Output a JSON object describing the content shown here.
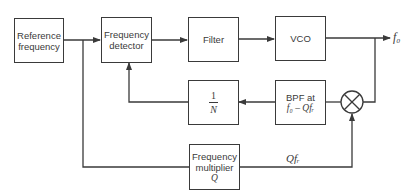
{
  "diagram": {
    "type": "block-diagram",
    "blocks": [
      {
        "id": "ref",
        "line1": "Reference",
        "line2": "frequency"
      },
      {
        "id": "det",
        "line1": "Frequency",
        "line2": "detector"
      },
      {
        "id": "filter",
        "label": "Filter"
      },
      {
        "id": "vco",
        "label": "VCO"
      },
      {
        "id": "divider",
        "num": "1",
        "den": "N"
      },
      {
        "id": "bpf",
        "line1": "BPF at",
        "line2": "f₀ – Qfᵣ"
      },
      {
        "id": "mult",
        "line1": "Frequency",
        "line2": "multiplier",
        "line3": "Q"
      }
    ],
    "mixer": {
      "symbol": "multiplier-circle"
    },
    "labels": {
      "output": "f₀",
      "mult_output": "Qfᵣ"
    },
    "connections": [
      "ref -> det",
      "det -> filter",
      "filter -> vco",
      "vco -> output f0",
      "output tap -> mixer",
      "mixer -> bpf",
      "bpf -> divider",
      "divider -> det",
      "ref tap -> mult",
      "mult -> mixer (Qfr)"
    ]
  }
}
